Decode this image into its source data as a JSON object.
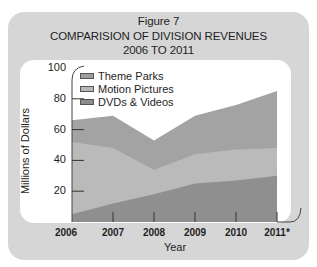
{
  "figure": {
    "label": "Figure 7",
    "title": "COMPARISION OF DIVISION REVENUES",
    "subtitle": "2006 TO 2011"
  },
  "axes": {
    "ylabel": "Millions of Dollars",
    "xlabel": "Year",
    "yticks": [
      "100",
      "80",
      "60",
      "40",
      "20"
    ],
    "xticks": [
      "2006",
      "2007",
      "2008",
      "2009",
      "2010",
      "2011*"
    ]
  },
  "legend": {
    "items": [
      {
        "label": "Theme Parks",
        "color": "#9e9e9e"
      },
      {
        "label": "Motion Pictures",
        "color": "#b8b8b8"
      },
      {
        "label": "DVDs & Videos",
        "color": "#8c8c8c"
      }
    ]
  },
  "colors": {
    "card_bg": "#d6d6d6",
    "panel_bg": "#ffffff",
    "theme_parks": "#a3a3a3",
    "motion_pictures": "#bababa",
    "dvds_videos": "#8f8f8f"
  },
  "chart_data": {
    "type": "area",
    "stacked": true,
    "xlabel": "Year",
    "ylabel": "Millions of Dollars",
    "categories": [
      "2006",
      "2007",
      "2008",
      "2009",
      "2010",
      "2011*"
    ],
    "ylim": [
      0,
      100
    ],
    "yticks": [
      20,
      40,
      60,
      80,
      100
    ],
    "grid": false,
    "legend_position": "top-left inside plot",
    "series": [
      {
        "name": "DVDs & Videos",
        "values": [
          5,
          12,
          18,
          25,
          27,
          30
        ]
      },
      {
        "name": "Motion Pictures",
        "values": [
          47,
          36,
          16,
          19,
          20,
          18
        ]
      },
      {
        "name": "Theme Parks",
        "values": [
          14,
          21,
          19,
          25,
          29,
          37
        ]
      }
    ],
    "stack_totals": [
      66,
      69,
      53,
      69,
      76,
      85
    ]
  }
}
